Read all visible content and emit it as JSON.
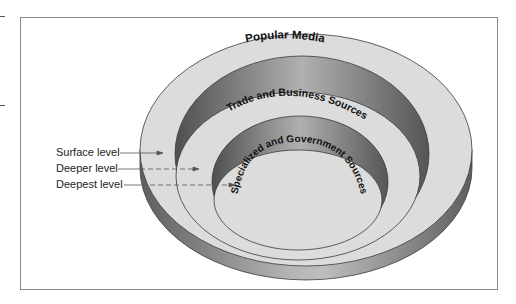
{
  "diagram": {
    "type": "concentric-rings-3d",
    "rings": [
      {
        "label": "Popular Media",
        "level": "surface"
      },
      {
        "label": "Trade and Business Sources",
        "level": "deeper"
      },
      {
        "label": "Specialized and Government Sources",
        "level": "deepest"
      }
    ],
    "levels": [
      {
        "label": "Surface level",
        "arrow": "solid"
      },
      {
        "label": "Deeper level",
        "arrow": "dashed"
      },
      {
        "label": "Deepest level",
        "arrow": "dashed"
      }
    ],
    "colors": {
      "ring_surface": "#dcdcdc",
      "wall_dark": "#6e6e6e",
      "wall_light": "#a8a8a8",
      "outline": "#3a3a3a",
      "frame": "#8a8a8a",
      "text": "#111111"
    }
  }
}
